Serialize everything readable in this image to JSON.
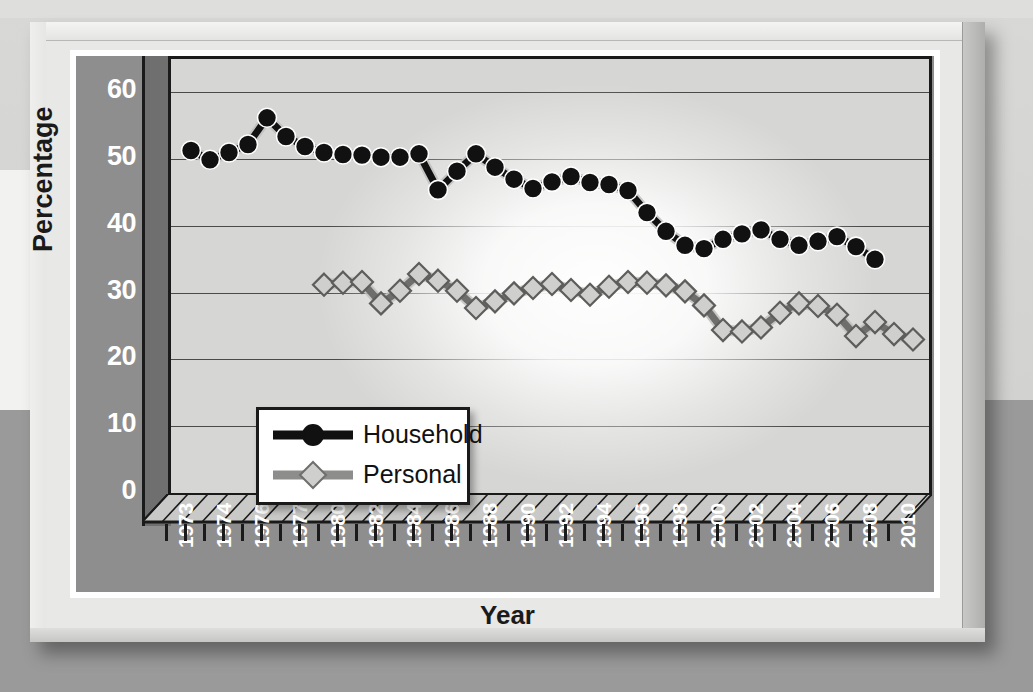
{
  "chart_data": {
    "type": "line",
    "title": "",
    "xlabel": "Year",
    "ylabel": "Percentage",
    "ylim": [
      0,
      65
    ],
    "yticks": [
      0,
      10,
      20,
      30,
      40,
      50,
      60
    ],
    "grid": true,
    "legend_position": "inside-lower-left",
    "x": [
      1973,
      1974,
      1975,
      1976,
      1977,
      1978,
      1979,
      1980,
      1981,
      1982,
      1983,
      1984,
      1985,
      1986,
      1987,
      1988,
      1989,
      1990,
      1991,
      1992,
      1993,
      1994,
      1995,
      1996,
      1997,
      1998,
      1999,
      2000,
      2001,
      2002,
      2003,
      2004,
      2005,
      2006,
      2007,
      2008,
      2009,
      2010,
      2011
    ],
    "xticklabels": [
      "1973",
      "1974",
      "1976",
      "1977",
      "1980",
      "1982",
      "1984",
      "1986",
      "1988",
      "1990",
      "1992",
      "1994",
      "1996",
      "1998",
      "2000",
      "2002",
      "2004",
      "2006",
      "2008",
      "2010"
    ],
    "series": [
      {
        "name": "Household",
        "marker": "circle",
        "color": "#111111",
        "values": [
          51.3,
          49.9,
          51.0,
          52.2,
          56.2,
          53.4,
          51.9,
          51.0,
          50.7,
          50.6,
          50.3,
          50.3,
          50.8,
          45.4,
          48.2,
          50.8,
          48.8,
          47.0,
          45.6,
          46.6,
          47.4,
          46.5,
          46.2,
          45.3,
          42.0,
          39.2,
          37.1,
          36.6,
          38.0,
          38.8,
          39.4,
          38.0,
          37.1,
          37.7,
          38.4,
          36.9,
          35.0,
          null,
          null
        ]
      },
      {
        "name": "Personal",
        "marker": "diamond",
        "color": "#c9c9c7",
        "values": [
          null,
          null,
          null,
          null,
          null,
          null,
          null,
          31.2,
          31.5,
          31.6,
          28.4,
          30.3,
          32.8,
          31.8,
          30.3,
          27.7,
          28.7,
          29.9,
          30.7,
          31.3,
          30.4,
          29.7,
          30.9,
          31.6,
          31.5,
          31.1,
          30.2,
          28.1,
          24.4,
          24.2,
          24.8,
          27.0,
          28.4,
          28.0,
          26.7,
          23.5,
          25.6,
          23.8,
          23.0
        ]
      }
    ],
    "legend": [
      {
        "label": "Household",
        "marker": "circle",
        "color": "#111111"
      },
      {
        "label": "Personal",
        "marker": "diamond",
        "color": "#c9c9c7"
      }
    ]
  },
  "colors": {
    "household": "#111111",
    "personal": "#c9c9c7",
    "axis_panel": "#8e8e8e",
    "plot_bg": "#d6d6d4",
    "frame": "#e8e8e6",
    "gridline": "#4a4a4a",
    "tick_text": "#ffffff",
    "label_text": "#1a1a1a"
  }
}
